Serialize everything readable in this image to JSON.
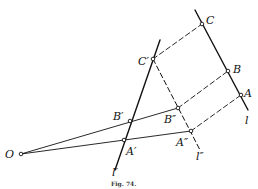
{
  "figure": {
    "caption": "Fig. 74.",
    "points": {
      "O": {
        "label": "O",
        "x": 21,
        "y": 154
      },
      "A": {
        "label": "A",
        "x": 241,
        "y": 95
      },
      "B": {
        "label": "B",
        "x": 228,
        "y": 71
      },
      "C": {
        "label": "C",
        "x": 202,
        "y": 24
      },
      "A1": {
        "label": "A′",
        "x": 124,
        "y": 140
      },
      "B1": {
        "label": "B′",
        "x": 130,
        "y": 121
      },
      "C1": {
        "label": "C′",
        "x": 153,
        "y": 59
      },
      "A2": {
        "label": "A″",
        "x": 191,
        "y": 131
      },
      "B2": {
        "label": "B″",
        "x": 178,
        "y": 108
      }
    },
    "lines": {
      "l": {
        "label": "l"
      },
      "l1": {
        "label": "l′"
      },
      "l2": {
        "label": "l″"
      }
    },
    "colors": {
      "ink": "#111111",
      "background": "#ffffff"
    }
  }
}
